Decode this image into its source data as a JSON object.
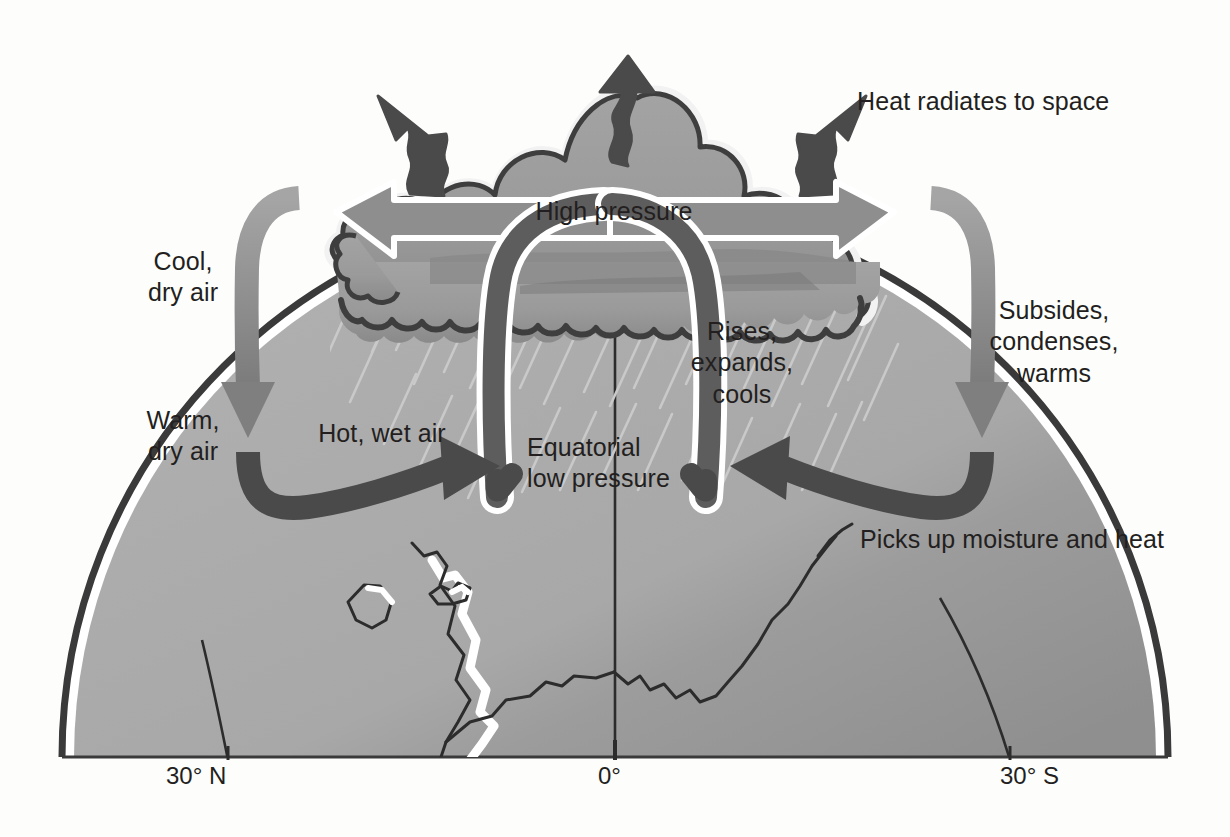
{
  "diagram": {
    "type": "atmospheric-circulation-cross-section",
    "colors": {
      "ink": "#231f20",
      "cloud_fill": "#9a9a9a",
      "cloud_shadow": "#7d7d7d",
      "cloud_outline": "#4a4a4a",
      "band_mid_gray": "#8e8e8e",
      "band_dark_gray": "#5d5d5d",
      "globe_land": "#a8a8a8",
      "globe_shade": "#9a9a9a",
      "globe_rim": "#3a3a3a",
      "rain_streak": "#c9c9c9",
      "page_background": "#fdfdfc"
    },
    "labels": {
      "heat_radiates": "Heat radiates to space",
      "high_pressure": "High pressure",
      "cool_dry_air": "Cool,\ndry air",
      "warm_dry_air": "Warm,\ndry air",
      "hot_wet_air": "Hot, wet air",
      "equatorial_low_pressure": "Equatorial\nlow pressure",
      "rises_expands_cools": "Rises,\nexpands,\ncools",
      "subsides_condenses_warms": "Subsides,\ncondenses,\nwarms",
      "picks_up_moisture": "Picks up moisture and heat"
    },
    "axis": {
      "ticks": [
        {
          "id": "lat-30-n",
          "label": "30° N"
        },
        {
          "id": "lat-0",
          "label": "0°"
        },
        {
          "id": "lat-30-s",
          "label": "30° S"
        }
      ]
    },
    "elements": {
      "cumulonimbus_cloud": "cloud-icon",
      "heat_arrow_left": "wavy-arrow-up-left-icon",
      "heat_arrow_center": "wavy-arrow-up-icon",
      "heat_arrow_right": "wavy-arrow-up-right-icon",
      "outflow_arrow_left": "arrow-left-icon",
      "outflow_arrow_right": "arrow-right-icon",
      "descending_band_left": "curved-arrow-down-icon",
      "descending_band_right": "curved-arrow-down-icon",
      "surface_inflow_left": "curved-arrow-right-icon",
      "surface_inflow_right": "curved-arrow-left-icon",
      "updraft_left": "updraft-band-icon",
      "updraft_right": "updraft-band-icon",
      "rain": "rain-streaks-icon",
      "globe": "globe-dome-icon"
    }
  }
}
